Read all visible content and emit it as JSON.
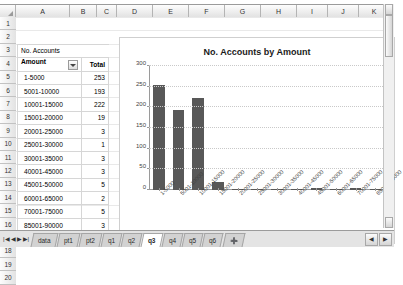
{
  "grid": {
    "columns": [
      "A",
      "B",
      "C",
      "D",
      "E",
      "F",
      "G",
      "H",
      "I",
      "J",
      "K"
    ],
    "rows": [
      "1",
      "2",
      "3",
      "4",
      "5",
      "6",
      "7",
      "8",
      "9",
      "10",
      "11",
      "12",
      "13",
      "14",
      "15",
      "16",
      "17",
      "18",
      "19",
      "20"
    ],
    "select_all_icon": "select-all-triangle-icon"
  },
  "pivot": {
    "title": "No. Accounts",
    "header_label": "Amount",
    "header_value": "Total",
    "filter_icon": "filter-dropdown-icon",
    "rows": [
      {
        "label": "1-5000",
        "value": "253"
      },
      {
        "label": "5001-10000",
        "value": "193"
      },
      {
        "label": "10001-15000",
        "value": "222"
      },
      {
        "label": "15001-20000",
        "value": "19"
      },
      {
        "label": "20001-25000",
        "value": "3"
      },
      {
        "label": "25001-30000",
        "value": "1"
      },
      {
        "label": "30001-35000",
        "value": "3"
      },
      {
        "label": "40001-45000",
        "value": "3"
      },
      {
        "label": "45001-50000",
        "value": "5"
      },
      {
        "label": "60001-65000",
        "value": "2"
      },
      {
        "label": "70001-75000",
        "value": "5"
      },
      {
        "label": "85001-90000",
        "value": "3"
      }
    ],
    "total_label": "Grand Total",
    "total_value": "712"
  },
  "chart_data": {
    "type": "bar",
    "title": "No. Accounts by Amount",
    "xlabel": "",
    "ylabel": "",
    "ylim": [
      0,
      300
    ],
    "yticks": [
      0,
      50,
      100,
      150,
      200,
      250,
      300
    ],
    "grid": true,
    "legend": "none",
    "bar_color": "#585858",
    "categories": [
      "1-5000",
      "5001-10000",
      "10001-15000",
      "15001-20000",
      "20001-25000",
      "25001-30000",
      "30001-35000",
      "40001-45000",
      "45001-50000",
      "60001-65000",
      "70001-75000",
      "85001-90000"
    ],
    "values": [
      253,
      193,
      222,
      19,
      3,
      1,
      3,
      3,
      5,
      2,
      5,
      3
    ]
  },
  "tabbar": {
    "nav": [
      "|◀",
      "◀",
      "▶",
      "▶|"
    ],
    "tabs": [
      {
        "label": "data",
        "active": false
      },
      {
        "label": "pt1",
        "active": false
      },
      {
        "label": "pt2",
        "active": false
      },
      {
        "label": "q1",
        "active": false
      },
      {
        "label": "q2",
        "active": false
      },
      {
        "label": "q3",
        "active": true
      },
      {
        "label": "q4",
        "active": false
      },
      {
        "label": "q5",
        "active": false
      },
      {
        "label": "q6",
        "active": false
      },
      {
        "label": "➕",
        "active": false
      }
    ],
    "scroll_left_icon": "◀",
    "scroll_right_icon": "▶"
  },
  "scrollbar": {
    "up_icon": "▲",
    "down_icon": "▼"
  }
}
